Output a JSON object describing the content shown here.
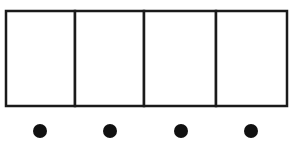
{
  "diagram": {
    "type": "row-of-cells-with-dots",
    "colors": {
      "stroke": "#1a1a1a",
      "fill": "#ffffff",
      "dot": "#111111"
    },
    "frame": {
      "x": 6,
      "y": 11,
      "width": 281,
      "height": 95,
      "stroke_width": 2.5
    },
    "cells": [
      {
        "index": 1,
        "x0": 6,
        "x1": 75
      },
      {
        "index": 2,
        "x0": 75,
        "x1": 144
      },
      {
        "index": 3,
        "x0": 144,
        "x1": 216
      },
      {
        "index": 4,
        "x0": 216,
        "x1": 287
      }
    ],
    "dividers_x": [
      75,
      144,
      216
    ],
    "dots": [
      {
        "cx": 40,
        "cy": 131,
        "r": 7
      },
      {
        "cx": 110,
        "cy": 131,
        "r": 7
      },
      {
        "cx": 181,
        "cy": 131,
        "r": 7
      },
      {
        "cx": 251,
        "cy": 131,
        "r": 7
      }
    ]
  }
}
